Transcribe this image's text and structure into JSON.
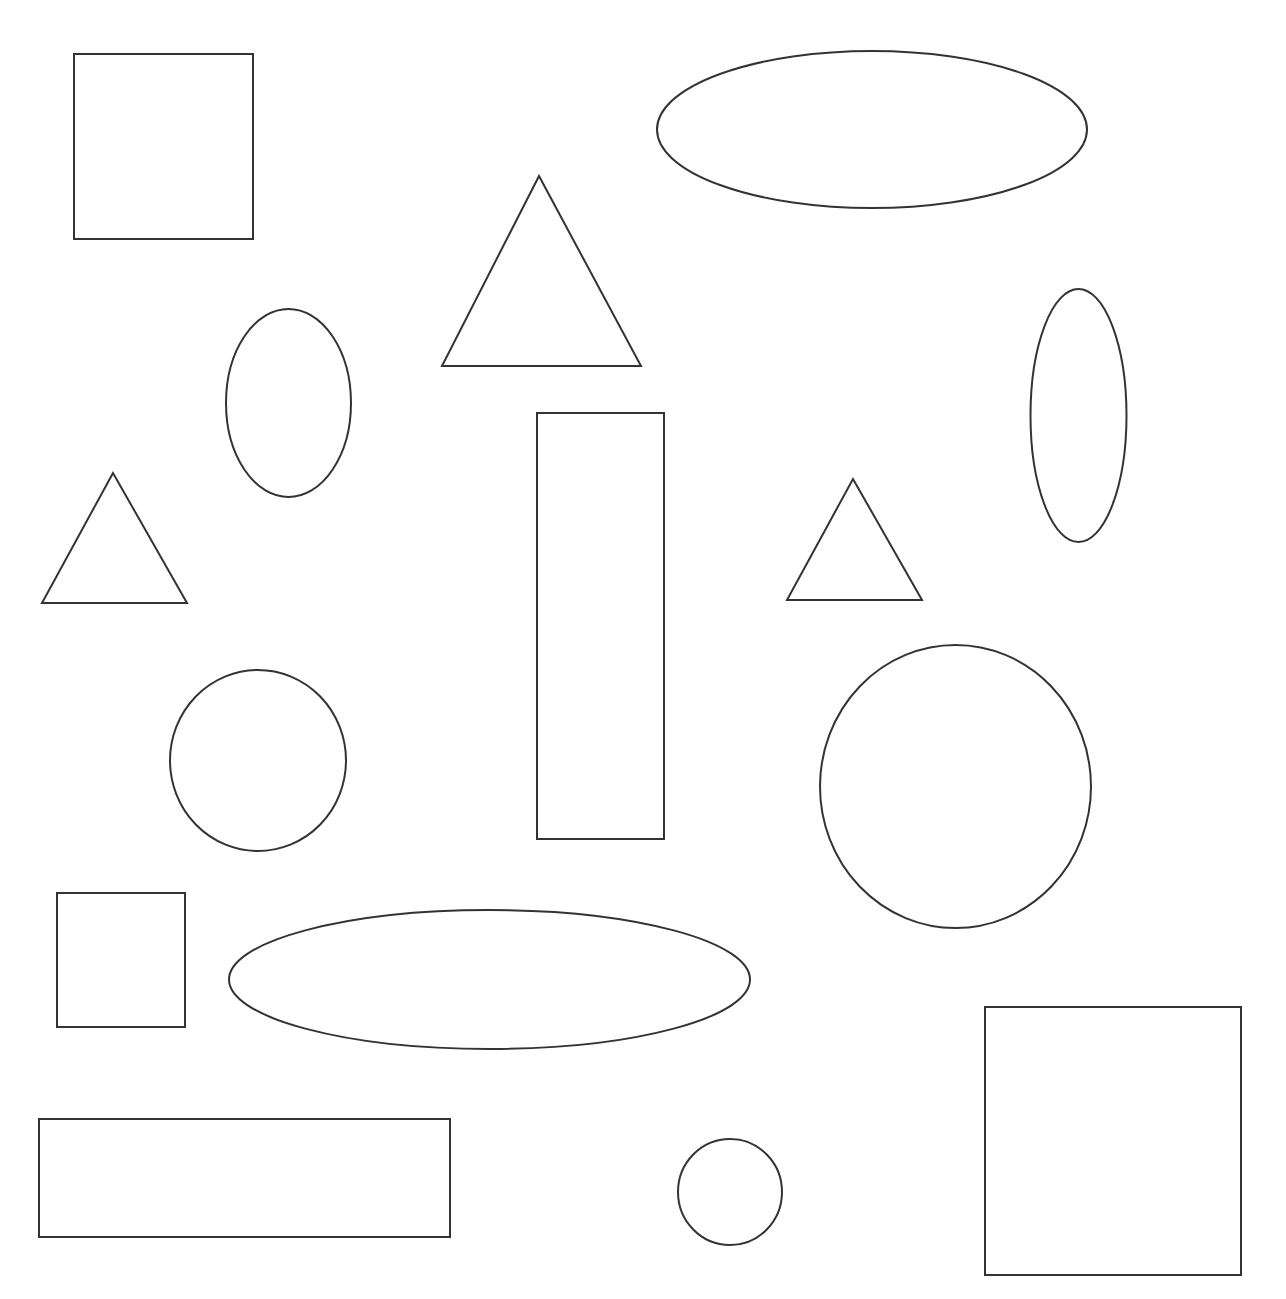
{
  "canvas": {
    "width": 1286,
    "height": 1299,
    "background": "#ffffff",
    "stroke_color": "#333333",
    "stroke_width": 2
  },
  "shapes": [
    {
      "id": "square-1",
      "type": "rect",
      "x": 74,
      "y": 54,
      "width": 179,
      "height": 185
    },
    {
      "id": "ellipse-1",
      "type": "ellipse",
      "cx": 872,
      "cy": 129.5,
      "rx": 215,
      "ry": 78.5
    },
    {
      "id": "triangle-1",
      "type": "polygon",
      "points": "539,176 442,366 641,366"
    },
    {
      "id": "ellipse-2",
      "type": "ellipse",
      "cx": 288.5,
      "cy": 403,
      "rx": 62.5,
      "ry": 94
    },
    {
      "id": "ellipse-3",
      "type": "ellipse",
      "cx": 1078.5,
      "cy": 415.5,
      "rx": 48,
      "ry": 126.5
    },
    {
      "id": "rectangle-tall",
      "type": "rect",
      "x": 537,
      "y": 413,
      "width": 127,
      "height": 426
    },
    {
      "id": "triangle-2",
      "type": "polygon",
      "points": "113,473 42,603 187,603"
    },
    {
      "id": "triangle-3",
      "type": "polygon",
      "points": "853,479 787,600 922,600"
    },
    {
      "id": "circle-1",
      "type": "ellipse",
      "cx": 258,
      "cy": 760.5,
      "rx": 88,
      "ry": 90.5
    },
    {
      "id": "circle-2",
      "type": "ellipse",
      "cx": 955.5,
      "cy": 786.5,
      "rx": 135.5,
      "ry": 141.5
    },
    {
      "id": "square-2",
      "type": "rect",
      "x": 57,
      "y": 893,
      "width": 128,
      "height": 134
    },
    {
      "id": "ellipse-4",
      "type": "ellipse",
      "cx": 489.5,
      "cy": 979.5,
      "rx": 260.5,
      "ry": 69.5
    },
    {
      "id": "rectangle-wide",
      "type": "rect",
      "x": 39,
      "y": 1119,
      "width": 411,
      "height": 118
    },
    {
      "id": "circle-3",
      "type": "ellipse",
      "cx": 730,
      "cy": 1192,
      "rx": 52,
      "ry": 53
    },
    {
      "id": "square-3",
      "type": "rect",
      "x": 985,
      "y": 1007,
      "width": 256,
      "height": 268
    }
  ]
}
